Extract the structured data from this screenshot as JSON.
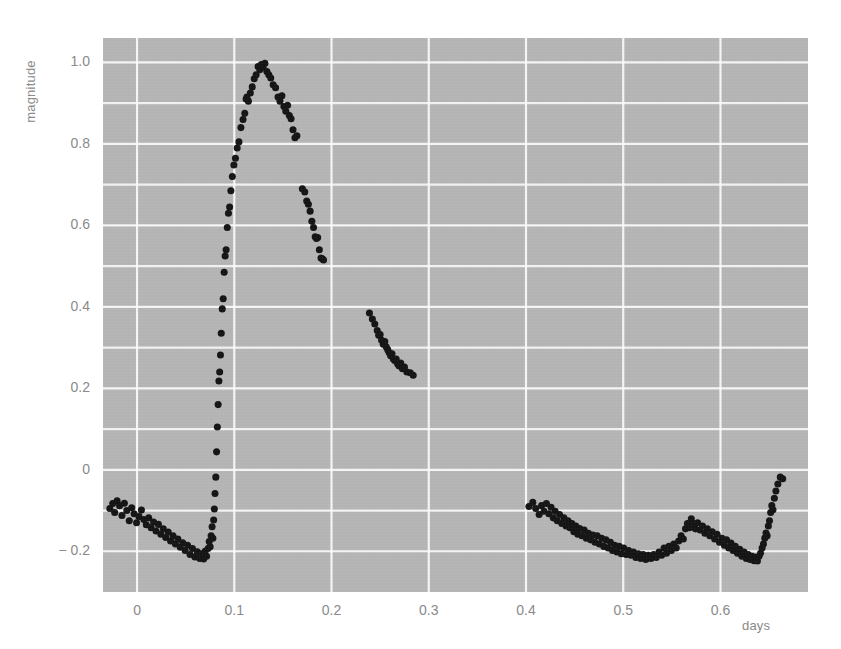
{
  "figure": {
    "background_color": "#ffffff",
    "plot_background_color": "#b6b6b6",
    "grid_color": "#ffffff",
    "point_color": "#141414",
    "tick_text_color": "#8a8a8a"
  },
  "chart_data": {
    "type": "scatter",
    "title": "",
    "xlabel": "days",
    "ylabel": "magnitude",
    "xlim": [
      -0.035,
      0.69
    ],
    "ylim": [
      -0.3,
      1.06
    ],
    "grid": true,
    "legend": null,
    "x_ticks": [
      0,
      0.1,
      0.2,
      0.3,
      0.4,
      0.5,
      0.6
    ],
    "x_tick_labels": [
      "0",
      "0.1",
      "0.2",
      "0.3",
      "0.4",
      "0.5",
      "0.6"
    ],
    "y_ticks": [
      -0.2,
      0,
      0.2,
      0.4,
      0.6,
      0.8,
      1.0
    ],
    "y_tick_labels": [
      "− 0.2",
      "0",
      "0.2",
      "0.4",
      "0.6",
      "0.8",
      "1.0"
    ],
    "y_minor_gridlines": [
      -0.1,
      0.1,
      0.3,
      0.5,
      0.7,
      0.9
    ],
    "series": [
      {
        "name": "light curve",
        "marker": "circle",
        "marker_size": 4,
        "points": [
          [
            -0.028,
            -0.095
          ],
          [
            -0.025,
            -0.083
          ],
          [
            -0.023,
            -0.105
          ],
          [
            -0.0205,
            -0.076
          ],
          [
            -0.018,
            -0.088
          ],
          [
            -0.0155,
            -0.112
          ],
          [
            -0.013,
            -0.082
          ],
          [
            -0.0105,
            -0.1
          ],
          [
            -0.008,
            -0.125
          ],
          [
            -0.0055,
            -0.093
          ],
          [
            -0.003,
            -0.108
          ],
          [
            -0.0005,
            -0.13
          ],
          [
            0.002,
            -0.115
          ],
          [
            0.0045,
            -0.099
          ],
          [
            0.007,
            -0.122
          ],
          [
            0.0095,
            -0.135
          ],
          [
            0.012,
            -0.118
          ],
          [
            0.0145,
            -0.142
          ],
          [
            0.017,
            -0.128
          ],
          [
            0.0195,
            -0.15
          ],
          [
            0.022,
            -0.134
          ],
          [
            0.0245,
            -0.158
          ],
          [
            0.027,
            -0.145
          ],
          [
            0.0295,
            -0.166
          ],
          [
            0.032,
            -0.153
          ],
          [
            0.0345,
            -0.175
          ],
          [
            0.037,
            -0.162
          ],
          [
            0.0395,
            -0.182
          ],
          [
            0.042,
            -0.17
          ],
          [
            0.0445,
            -0.19
          ],
          [
            0.047,
            -0.179
          ],
          [
            0.0495,
            -0.198
          ],
          [
            0.052,
            -0.185
          ],
          [
            0.0545,
            -0.208
          ],
          [
            0.057,
            -0.193
          ],
          [
            0.0595,
            -0.214
          ],
          [
            0.062,
            -0.201
          ],
          [
            0.0645,
            -0.218
          ],
          [
            0.0665,
            -0.206
          ],
          [
            0.0685,
            -0.219
          ],
          [
            0.07,
            -0.2
          ],
          [
            0.0715,
            -0.212
          ],
          [
            0.073,
            -0.193
          ],
          [
            0.0742,
            -0.176
          ],
          [
            0.0752,
            -0.189
          ],
          [
            0.0762,
            -0.162
          ],
          [
            0.0772,
            -0.14
          ],
          [
            0.078,
            -0.168
          ],
          [
            0.0788,
            -0.123
          ],
          [
            0.0795,
            -0.096
          ],
          [
            0.0802,
            -0.058
          ],
          [
            0.081,
            -0.018
          ],
          [
            0.0818,
            0.044
          ],
          [
            0.0826,
            0.105
          ],
          [
            0.0834,
            0.16
          ],
          [
            0.0842,
            0.218
          ],
          [
            0.085,
            0.24
          ],
          [
            0.0858,
            0.282
          ],
          [
            0.0866,
            0.335
          ],
          [
            0.0876,
            0.395
          ],
          [
            0.0886,
            0.42
          ],
          [
            0.0896,
            0.485
          ],
          [
            0.0906,
            0.525
          ],
          [
            0.0916,
            0.54
          ],
          [
            0.0928,
            0.595
          ],
          [
            0.094,
            0.63
          ],
          [
            0.0952,
            0.645
          ],
          [
            0.0965,
            0.685
          ],
          [
            0.098,
            0.72
          ],
          [
            0.0996,
            0.748
          ],
          [
            0.1012,
            0.765
          ],
          [
            0.103,
            0.79
          ],
          [
            0.1048,
            0.805
          ],
          [
            0.1068,
            0.84
          ],
          [
            0.109,
            0.86
          ],
          [
            0.1108,
            0.875
          ],
          [
            0.1122,
            0.91
          ],
          [
            0.113,
            0.915
          ],
          [
            0.1145,
            0.905
          ],
          [
            0.1165,
            0.925
          ],
          [
            0.1185,
            0.94
          ],
          [
            0.1205,
            0.96
          ],
          [
            0.1225,
            0.97
          ],
          [
            0.1245,
            0.99
          ],
          [
            0.1262,
            0.982
          ],
          [
            0.1278,
            0.995
          ],
          [
            0.1296,
            0.988
          ],
          [
            0.1315,
            0.998
          ],
          [
            0.1335,
            0.978
          ],
          [
            0.1355,
            0.97
          ],
          [
            0.1375,
            0.962
          ],
          [
            0.14,
            0.945
          ],
          [
            0.1425,
            0.938
          ],
          [
            0.145,
            0.915
          ],
          [
            0.147,
            0.905
          ],
          [
            0.149,
            0.918
          ],
          [
            0.151,
            0.892
          ],
          [
            0.153,
            0.88
          ],
          [
            0.1548,
            0.895
          ],
          [
            0.1566,
            0.87
          ],
          [
            0.1584,
            0.862
          ],
          [
            0.1604,
            0.835
          ],
          [
            0.1624,
            0.815
          ],
          [
            0.1644,
            0.82
          ],
          [
            0.17,
            0.69
          ],
          [
            0.1725,
            0.682
          ],
          [
            0.1745,
            0.66
          ],
          [
            0.1762,
            0.652
          ],
          [
            0.178,
            0.635
          ],
          [
            0.1798,
            0.61
          ],
          [
            0.1815,
            0.595
          ],
          [
            0.1832,
            0.572
          ],
          [
            0.1845,
            0.568
          ],
          [
            0.1858,
            0.57
          ],
          [
            0.1875,
            0.54
          ],
          [
            0.1892,
            0.52
          ],
          [
            0.1905,
            0.518
          ],
          [
            0.1918,
            0.515
          ],
          [
            0.239,
            0.385
          ],
          [
            0.242,
            0.37
          ],
          [
            0.2445,
            0.358
          ],
          [
            0.247,
            0.342
          ],
          [
            0.2485,
            0.33
          ],
          [
            0.25,
            0.332
          ],
          [
            0.2515,
            0.318
          ],
          [
            0.2532,
            0.308
          ],
          [
            0.2548,
            0.315
          ],
          [
            0.2562,
            0.302
          ],
          [
            0.2578,
            0.295
          ],
          [
            0.2592,
            0.288
          ],
          [
            0.2608,
            0.28
          ],
          [
            0.2622,
            0.285
          ],
          [
            0.2636,
            0.272
          ],
          [
            0.265,
            0.268
          ],
          [
            0.2665,
            0.272
          ],
          [
            0.268,
            0.26
          ],
          [
            0.2696,
            0.255
          ],
          [
            0.2712,
            0.262
          ],
          [
            0.273,
            0.248
          ],
          [
            0.275,
            0.252
          ],
          [
            0.2775,
            0.24
          ],
          [
            0.281,
            0.238
          ],
          [
            0.284,
            0.232
          ],
          [
            0.403,
            -0.09
          ],
          [
            0.407,
            -0.08
          ],
          [
            0.41,
            -0.095
          ],
          [
            0.4135,
            -0.11
          ],
          [
            0.416,
            -0.088
          ],
          [
            0.4185,
            -0.102
          ],
          [
            0.421,
            -0.083
          ],
          [
            0.4235,
            -0.108
          ],
          [
            0.4258,
            -0.092
          ],
          [
            0.428,
            -0.118
          ],
          [
            0.43,
            -0.102
          ],
          [
            0.4322,
            -0.125
          ],
          [
            0.4345,
            -0.11
          ],
          [
            0.4368,
            -0.132
          ],
          [
            0.439,
            -0.118
          ],
          [
            0.4412,
            -0.138
          ],
          [
            0.4432,
            -0.125
          ],
          [
            0.4452,
            -0.142
          ],
          [
            0.4472,
            -0.132
          ],
          [
            0.4492,
            -0.152
          ],
          [
            0.4512,
            -0.138
          ],
          [
            0.4532,
            -0.158
          ],
          [
            0.4552,
            -0.144
          ],
          [
            0.4575,
            -0.162
          ],
          [
            0.4598,
            -0.148
          ],
          [
            0.462,
            -0.168
          ],
          [
            0.4642,
            -0.156
          ],
          [
            0.4665,
            -0.172
          ],
          [
            0.4688,
            -0.16
          ],
          [
            0.471,
            -0.178
          ],
          [
            0.4732,
            -0.162
          ],
          [
            0.4755,
            -0.182
          ],
          [
            0.4778,
            -0.168
          ],
          [
            0.48,
            -0.188
          ],
          [
            0.4822,
            -0.172
          ],
          [
            0.4845,
            -0.192
          ],
          [
            0.4868,
            -0.178
          ],
          [
            0.489,
            -0.198
          ],
          [
            0.4912,
            -0.185
          ],
          [
            0.4935,
            -0.202
          ],
          [
            0.4958,
            -0.188
          ],
          [
            0.498,
            -0.206
          ],
          [
            0.5005,
            -0.192
          ],
          [
            0.503,
            -0.208
          ],
          [
            0.5055,
            -0.198
          ],
          [
            0.508,
            -0.21
          ],
          [
            0.5105,
            -0.202
          ],
          [
            0.513,
            -0.215
          ],
          [
            0.5155,
            -0.206
          ],
          [
            0.518,
            -0.218
          ],
          [
            0.5205,
            -0.208
          ],
          [
            0.5232,
            -0.22
          ],
          [
            0.5258,
            -0.21
          ],
          [
            0.5285,
            -0.218
          ],
          [
            0.5312,
            -0.208
          ],
          [
            0.534,
            -0.215
          ],
          [
            0.5368,
            -0.202
          ],
          [
            0.5395,
            -0.21
          ],
          [
            0.542,
            -0.192
          ],
          [
            0.5445,
            -0.205
          ],
          [
            0.547,
            -0.188
          ],
          [
            0.5495,
            -0.198
          ],
          [
            0.552,
            -0.182
          ],
          [
            0.5545,
            -0.192
          ],
          [
            0.557,
            -0.175
          ],
          [
            0.5595,
            -0.162
          ],
          [
            0.5618,
            -0.17
          ],
          [
            0.564,
            -0.145
          ],
          [
            0.566,
            -0.132
          ],
          [
            0.568,
            -0.142
          ],
          [
            0.57,
            -0.12
          ],
          [
            0.572,
            -0.132
          ],
          [
            0.5742,
            -0.145
          ],
          [
            0.5765,
            -0.13
          ],
          [
            0.579,
            -0.148
          ],
          [
            0.5815,
            -0.138
          ],
          [
            0.584,
            -0.156
          ],
          [
            0.5865,
            -0.145
          ],
          [
            0.589,
            -0.162
          ],
          [
            0.5915,
            -0.152
          ],
          [
            0.594,
            -0.17
          ],
          [
            0.5965,
            -0.158
          ],
          [
            0.599,
            -0.178
          ],
          [
            0.6015,
            -0.168
          ],
          [
            0.604,
            -0.185
          ],
          [
            0.6062,
            -0.172
          ],
          [
            0.6085,
            -0.192
          ],
          [
            0.6108,
            -0.18
          ],
          [
            0.613,
            -0.198
          ],
          [
            0.6152,
            -0.188
          ],
          [
            0.6175,
            -0.205
          ],
          [
            0.6198,
            -0.195
          ],
          [
            0.622,
            -0.212
          ],
          [
            0.6242,
            -0.202
          ],
          [
            0.6265,
            -0.218
          ],
          [
            0.6285,
            -0.208
          ],
          [
            0.6305,
            -0.22
          ],
          [
            0.6325,
            -0.212
          ],
          [
            0.6345,
            -0.223
          ],
          [
            0.6362,
            -0.215
          ],
          [
            0.638,
            -0.224
          ],
          [
            0.6396,
            -0.212
          ],
          [
            0.6412,
            -0.205
          ],
          [
            0.6428,
            -0.192
          ],
          [
            0.6442,
            -0.182
          ],
          [
            0.6456,
            -0.168
          ],
          [
            0.6468,
            -0.155
          ],
          [
            0.648,
            -0.162
          ],
          [
            0.6492,
            -0.138
          ],
          [
            0.6504,
            -0.125
          ],
          [
            0.6516,
            -0.105
          ],
          [
            0.6528,
            -0.088
          ],
          [
            0.654,
            -0.098
          ],
          [
            0.6554,
            -0.07
          ],
          [
            0.657,
            -0.052
          ],
          [
            0.659,
            -0.035
          ],
          [
            0.6615,
            -0.018
          ],
          [
            0.664,
            -0.022
          ]
        ]
      }
    ]
  }
}
